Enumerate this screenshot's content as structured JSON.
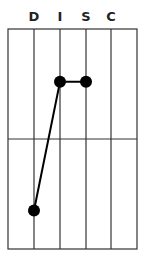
{
  "chart_data": {
    "type": "line",
    "title": "",
    "categories": [
      "D",
      "I",
      "S",
      "C"
    ],
    "series": [
      {
        "name": "DISC profile",
        "values": [
          -65,
          52,
          52,
          null
        ]
      }
    ],
    "xlabel": "",
    "ylabel": "",
    "ylim": [
      -100,
      100
    ],
    "grid": true,
    "midline": 0
  },
  "labels": [
    "D",
    "I",
    "S",
    "C"
  ],
  "colors": {
    "line": "#000000",
    "grid": "#333333",
    "background": "#ffffff"
  }
}
